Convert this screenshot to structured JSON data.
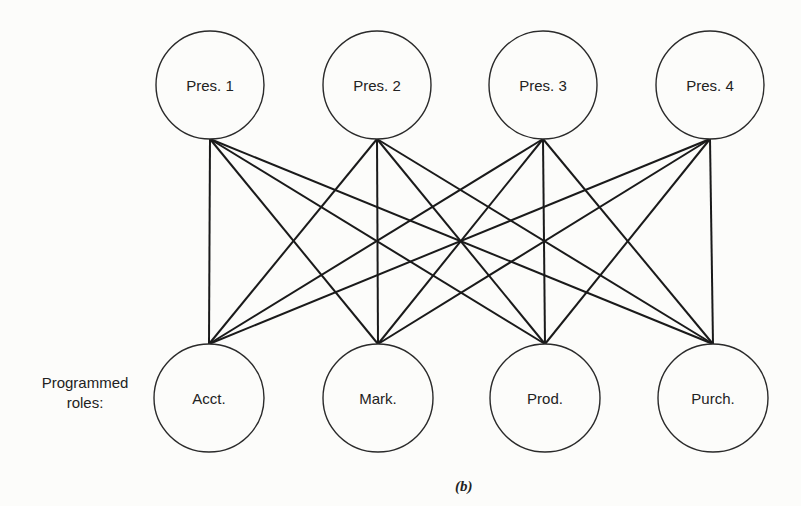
{
  "figure": {
    "caption": "(b)",
    "side_label_line1": "Programmed",
    "side_label_line2": "roles:",
    "stroke_color": "#1a1a1a",
    "background_color": "#fcfcfa"
  },
  "top_nodes": [
    {
      "id": "pres1",
      "label": "Pres. 1",
      "cx": 210,
      "cy": 85,
      "rx": 54,
      "ry": 54
    },
    {
      "id": "pres2",
      "label": "Pres. 2",
      "cx": 377,
      "cy": 85,
      "rx": 54,
      "ry": 54
    },
    {
      "id": "pres3",
      "label": "Pres. 3",
      "cx": 543,
      "cy": 85,
      "rx": 54,
      "ry": 54
    },
    {
      "id": "pres4",
      "label": "Pres. 4",
      "cx": 710,
      "cy": 85,
      "rx": 54,
      "ry": 54
    }
  ],
  "bottom_nodes": [
    {
      "id": "acct",
      "label": "Acct.",
      "cx": 209,
      "cy": 398,
      "rx": 55,
      "ry": 54
    },
    {
      "id": "mark",
      "label": "Mark.",
      "cx": 378,
      "cy": 398,
      "rx": 55,
      "ry": 54
    },
    {
      "id": "prod",
      "label": "Prod.",
      "cx": 545,
      "cy": 398,
      "rx": 55,
      "ry": 54
    },
    {
      "id": "purch",
      "label": "Purch.",
      "cx": 713,
      "cy": 398,
      "rx": 55,
      "ry": 54
    }
  ],
  "edges": {
    "top_anchor_y": 139,
    "bottom_anchor_y": 344,
    "top_anchor_x": [
      210,
      377,
      543,
      710
    ],
    "bottom_anchor_x": [
      209,
      378,
      545,
      713
    ],
    "connectivity": "complete-bipartite"
  }
}
